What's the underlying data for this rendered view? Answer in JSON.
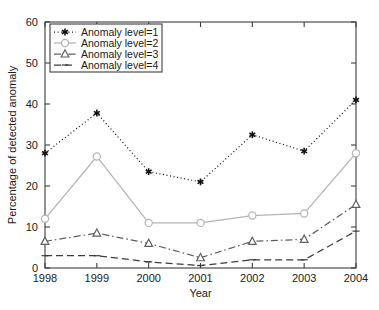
{
  "chart_data": {
    "type": "line",
    "title": "",
    "xlabel": "Year",
    "ylabel": "Percentage of detected anomaly",
    "x": [
      1998,
      1999,
      2000,
      2001,
      2002,
      2003,
      2004
    ],
    "xtick_labels": [
      "1998",
      "1999",
      "2000",
      "2001",
      "2002",
      "2003",
      "2004"
    ],
    "ytick_labels": [
      "0",
      "10",
      "20",
      "30",
      "40",
      "50",
      "60"
    ],
    "ytick_values": [
      0,
      10,
      20,
      30,
      40,
      50,
      60
    ],
    "xlim": [
      1998,
      2004
    ],
    "ylim": [
      0,
      60
    ],
    "grid": false,
    "legend_position": "upper-left",
    "series": [
      {
        "name": "Anomaly level=1",
        "values": [
          28.0,
          37.8,
          23.5,
          21.0,
          32.5,
          28.5,
          41.0
        ],
        "line_style": "dotted",
        "marker": "asterisk",
        "color": "#111111"
      },
      {
        "name": "Anomaly level=2",
        "values": [
          12.0,
          27.2,
          11.0,
          11.0,
          12.8,
          13.3,
          28.0
        ],
        "line_style": "solid",
        "marker": "circle",
        "color": "#b3b3b3"
      },
      {
        "name": "Anomaly level=3",
        "values": [
          6.5,
          8.5,
          6.0,
          2.5,
          6.5,
          7.0,
          15.5
        ],
        "line_style": "dashdot",
        "marker": "triangle",
        "color": "#606060"
      },
      {
        "name": "Anomaly level=4",
        "values": [
          3.0,
          3.0,
          1.5,
          0.6,
          2.0,
          2.0,
          9.0
        ],
        "line_style": "dashed",
        "marker": "dash",
        "color": "#3c3c3c"
      }
    ]
  },
  "legend": {
    "entries": [
      {
        "label": "Anomaly level=1"
      },
      {
        "label": "Anomaly level=2"
      },
      {
        "label": "Anomaly level=3"
      },
      {
        "label": "Anomaly level=4"
      }
    ]
  },
  "colors": {
    "axis": "#3c3c3c",
    "text": "#1a1a1a",
    "background": "#ffffff"
  }
}
